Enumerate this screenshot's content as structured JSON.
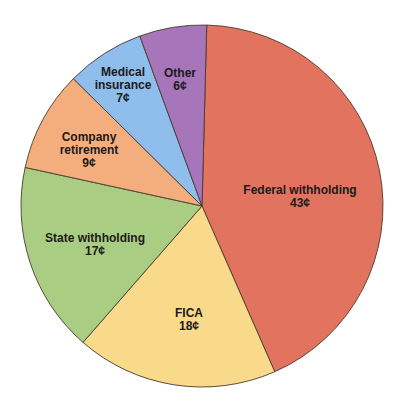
{
  "chart_data": {
    "type": "pie",
    "title": "",
    "unit": "¢",
    "start_angle_deg": 1.5,
    "direction": "clockwise",
    "categories": [
      "Federal withholding",
      "FICA",
      "State withholding",
      "Company retirement",
      "Medical insurance",
      "Other"
    ],
    "values": [
      43,
      18,
      17,
      9,
      7,
      6
    ],
    "colors": [
      "#e2735f",
      "#f9d98a",
      "#a9cd82",
      "#f4ad7c",
      "#8fbdec",
      "#a775b9"
    ],
    "labels": [
      {
        "lines": [
          "Federal withholding",
          "43¢"
        ],
        "x": 300,
        "y": 197
      },
      {
        "lines": [
          "FICA",
          "18¢"
        ],
        "x": 189,
        "y": 320
      },
      {
        "lines": [
          "State withholding",
          "17¢"
        ],
        "x": 95,
        "y": 245
      },
      {
        "lines": [
          "Company",
          "retirement",
          "9¢"
        ],
        "x": 89,
        "y": 150
      },
      {
        "lines": [
          "Medical",
          "insurance",
          "7¢"
        ],
        "x": 123,
        "y": 85
      },
      {
        "lines": [
          "Other",
          "6¢"
        ],
        "x": 180,
        "y": 80
      }
    ],
    "legend": "none",
    "center": [
      202,
      206
    ],
    "radius": 181
  }
}
